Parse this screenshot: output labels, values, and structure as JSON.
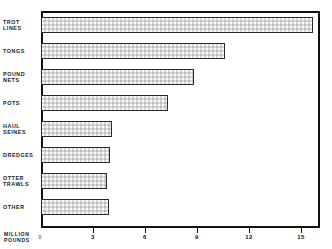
{
  "chart_data": {
    "type": "bar",
    "orientation": "horizontal",
    "title": "VIRGINIA — CATCH BY GEAR, 1971",
    "xlabel": "MILLION POUNDS",
    "ylabel": "",
    "categories": [
      "TROT LINES",
      "TONGS",
      "POUND NETS",
      "POTS",
      "HAUL SEINES",
      "DREDGES",
      "OTTER TRAWLS",
      "OTHER"
    ],
    "values": [
      15.7,
      10.6,
      8.8,
      7.3,
      4.1,
      4.0,
      3.8,
      3.9
    ],
    "xlim": [
      0,
      16.1
    ],
    "xticks": [
      0,
      3,
      6,
      9,
      12,
      15
    ],
    "xticklabels": [
      "0",
      "3",
      "6",
      "9",
      "12",
      "15"
    ],
    "grid": false,
    "legend": false
  },
  "labels": {
    "trot_lines": [
      "TROT",
      "LINES"
    ],
    "tongs": [
      "TONGS"
    ],
    "pound_nets": [
      "POUND",
      "NETS"
    ],
    "pots": [
      "POTS"
    ],
    "haul_seines": [
      "HAUL",
      "SEINES"
    ],
    "dredges": [
      "DREDGES"
    ],
    "otter_trawls": [
      "OTTER",
      "TRAWLS"
    ],
    "other": [
      "OTHER"
    ],
    "axis_title_line1": "MILLION",
    "axis_title_line2": "POUNDS"
  },
  "colors": {
    "bar_fill": "#d7d7d7",
    "bar_border": "#2a2a2a",
    "frame": "#111111",
    "text": "#1a1a1a",
    "background": "#ffffff"
  }
}
